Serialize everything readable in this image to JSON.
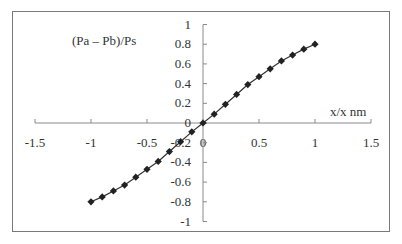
{
  "chart_data": {
    "type": "line",
    "title": "",
    "ylabel": "(Pa  – Pb)/Ps",
    "xlabel": "x/x  nm",
    "xlim": [
      -1.5,
      1.5
    ],
    "ylim": [
      -1,
      1
    ],
    "x_ticks": [
      "-1.5",
      "-1",
      "-0.5",
      "0",
      "0.5",
      "1",
      "1.5"
    ],
    "y_ticks": [
      "1",
      "0.8",
      "0.6",
      "0.4",
      "0.2",
      "0",
      "-0.2",
      "-0.4",
      "-0.6",
      "-0.8",
      "-1"
    ],
    "grid": false,
    "legend": null,
    "marker": "diamond",
    "series": [
      {
        "name": "(Pa - Pb)/Ps",
        "x": [
          -1,
          -0.9,
          -0.8,
          -0.7,
          -0.6,
          -0.5,
          -0.4,
          -0.3,
          -0.2,
          -0.1,
          0,
          0.1,
          0.2,
          0.3,
          0.4,
          0.5,
          0.6,
          0.7,
          0.8,
          0.9,
          1
        ],
        "y": [
          -0.8,
          -0.75,
          -0.69,
          -0.63,
          -0.55,
          -0.47,
          -0.39,
          -0.29,
          -0.19,
          -0.09,
          0,
          0.09,
          0.19,
          0.29,
          0.39,
          0.47,
          0.55,
          0.63,
          0.69,
          0.75,
          0.8
        ]
      }
    ]
  }
}
